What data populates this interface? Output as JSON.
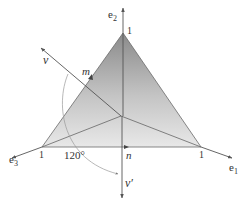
{
  "figure": {
    "axes": {
      "e1": {
        "label": "e",
        "sub": "1",
        "tick": "1"
      },
      "e2": {
        "label": "e",
        "sub": "2",
        "tick": "1"
      },
      "e3": {
        "label": "e",
        "sub": "3",
        "tick": "1"
      }
    },
    "vectors": {
      "v": {
        "label": "v"
      },
      "v_prime": {
        "label": "v′"
      }
    },
    "points": {
      "m": {
        "label": "m"
      },
      "n": {
        "label": "n"
      }
    },
    "angle": {
      "label": "120°"
    },
    "colors": {
      "triangle_top": "#8c8c8c",
      "triangle_bottom": "#e6e6e6",
      "lines": "#555555",
      "arc": "#9a9a9a"
    }
  }
}
